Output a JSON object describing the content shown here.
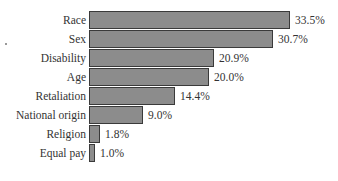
{
  "chart_data": {
    "type": "bar",
    "orientation": "horizontal",
    "title": "",
    "xlabel": "",
    "ylabel": "",
    "categories": [
      "Race",
      "Sex",
      "Disability",
      "Age",
      "Retaliation",
      "National origin",
      "Religion",
      "Equal pay"
    ],
    "values": [
      33.5,
      30.7,
      20.9,
      20.0,
      14.4,
      9.0,
      1.8,
      1.0
    ],
    "value_labels": [
      "33.5%",
      "30.7%",
      "20.9%",
      "20.0%",
      "14.4%",
      "9.0%",
      "1.8%",
      "1.0%"
    ],
    "unit": "%",
    "grid": false,
    "legend": null,
    "bar_color": "#8c8c8c",
    "bar_border_color": "#3a3a3a"
  }
}
